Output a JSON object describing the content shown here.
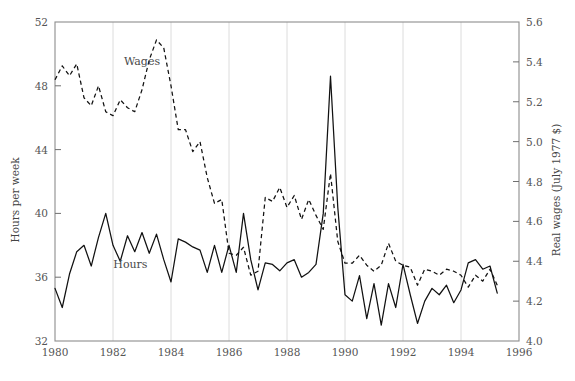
{
  "chart_data": {
    "type": "line",
    "title": "",
    "xlabel": "",
    "ylabel": "Hours per week",
    "y2label": "Real wages (July 1977 $)",
    "xlim": [
      1980,
      1996
    ],
    "ylim": [
      32,
      52
    ],
    "y2lim": [
      4.0,
      5.6
    ],
    "xticks": [
      1980,
      1982,
      1984,
      1986,
      1988,
      1990,
      1992,
      1994,
      1996
    ],
    "xtick_labels": [
      "1980",
      "1982",
      "1984",
      "1986",
      "1988",
      "1990",
      "1992",
      "1994",
      "1996"
    ],
    "yticks": [
      32,
      36,
      40,
      44,
      48,
      52
    ],
    "ytick_labels": [
      "32",
      "36",
      "40",
      "44",
      "48",
      "52"
    ],
    "y2ticks": [
      4.0,
      4.2,
      4.4,
      4.6,
      4.8,
      5.0,
      5.2,
      5.4,
      5.6
    ],
    "y2tick_labels": [
      "4.0",
      "4.2",
      "4.4",
      "4.6",
      "4.8",
      "5.0",
      "5.2",
      "5.4",
      "5.6"
    ],
    "grid": "vertical-only",
    "legend": "inline-annotations",
    "annotations": [
      {
        "text": "Wages",
        "x": 1983.0,
        "y": 49.3,
        "axis": "left"
      },
      {
        "text": "Hours",
        "x": 1982.6,
        "y": 36.6,
        "axis": "left"
      }
    ],
    "series": [
      {
        "name": "Hours",
        "label": "Hours",
        "style": "solid",
        "axis": "left",
        "units": "hours per week",
        "x": [
          1980.0,
          1980.25,
          1980.5,
          1980.75,
          1981.0,
          1981.25,
          1981.5,
          1981.75,
          1982.0,
          1982.25,
          1982.5,
          1982.75,
          1983.0,
          1983.25,
          1983.5,
          1983.75,
          1984.0,
          1984.25,
          1984.5,
          1984.75,
          1985.0,
          1985.25,
          1985.5,
          1985.75,
          1986.0,
          1986.25,
          1986.5,
          1986.75,
          1987.0,
          1987.25,
          1987.5,
          1987.75,
          1988.0,
          1988.25,
          1988.5,
          1988.75,
          1989.0,
          1989.25,
          1989.5,
          1989.75,
          1990.0,
          1990.25,
          1990.5,
          1990.75,
          1991.0,
          1991.25,
          1991.5,
          1991.75,
          1992.0,
          1992.25,
          1992.5,
          1992.75,
          1993.0,
          1993.25,
          1993.5,
          1993.75,
          1994.0,
          1994.25,
          1994.5,
          1994.75,
          1995.0,
          1995.25
        ],
        "y": [
          35.3,
          34.1,
          36.2,
          37.6,
          38.0,
          36.7,
          38.5,
          40.0,
          38.0,
          37.0,
          38.6,
          37.6,
          38.8,
          37.5,
          38.7,
          37.1,
          35.7,
          38.4,
          38.2,
          37.9,
          37.7,
          36.3,
          38.0,
          36.3,
          38.0,
          36.3,
          40.0,
          37.1,
          35.2,
          36.9,
          36.8,
          36.4,
          36.9,
          37.1,
          36.0,
          36.3,
          36.8,
          40.0,
          48.6,
          40.4,
          34.9,
          34.5,
          36.1,
          33.4,
          35.6,
          33.0,
          35.6,
          34.1,
          36.8,
          34.9,
          33.1,
          34.5,
          35.3,
          34.9,
          35.5,
          34.4,
          35.2,
          36.9,
          37.1,
          36.5,
          36.7,
          35.0
        ]
      },
      {
        "name": "Wages",
        "label": "Wages",
        "style": "dashed",
        "axis": "right",
        "units": "July 1977 dollars",
        "x": [
          1980.0,
          1980.25,
          1980.5,
          1980.75,
          1981.0,
          1981.25,
          1981.5,
          1981.75,
          1982.0,
          1982.25,
          1982.5,
          1982.75,
          1983.0,
          1983.25,
          1983.5,
          1983.75,
          1984.0,
          1984.25,
          1984.5,
          1984.75,
          1985.0,
          1985.25,
          1985.5,
          1985.75,
          1986.0,
          1986.25,
          1986.5,
          1986.75,
          1987.0,
          1987.25,
          1987.5,
          1987.75,
          1988.0,
          1988.25,
          1988.5,
          1988.75,
          1989.0,
          1989.25,
          1989.5,
          1989.75,
          1990.0,
          1990.25,
          1990.5,
          1990.75,
          1991.0,
          1991.25,
          1991.5,
          1991.75,
          1992.0,
          1992.25,
          1992.5,
          1992.75,
          1993.0,
          1993.25,
          1993.5,
          1993.75,
          1994.0,
          1994.25,
          1994.5,
          1994.75,
          1995.0,
          1995.25
        ],
        "y": [
          5.31,
          5.38,
          5.33,
          5.39,
          5.22,
          5.18,
          5.28,
          5.15,
          5.13,
          5.21,
          5.17,
          5.15,
          5.26,
          5.41,
          5.51,
          5.47,
          5.28,
          5.06,
          5.06,
          4.95,
          5.0,
          4.82,
          4.69,
          4.71,
          4.44,
          4.43,
          4.47,
          4.33,
          4.35,
          4.72,
          4.7,
          4.77,
          4.67,
          4.73,
          4.61,
          4.71,
          4.63,
          4.56,
          4.84,
          4.5,
          4.39,
          4.39,
          4.43,
          4.38,
          4.35,
          4.38,
          4.49,
          4.4,
          4.38,
          4.37,
          4.28,
          4.36,
          4.35,
          4.33,
          4.36,
          4.35,
          4.33,
          4.27,
          4.33,
          4.3,
          4.36,
          4.28
        ]
      }
    ]
  }
}
